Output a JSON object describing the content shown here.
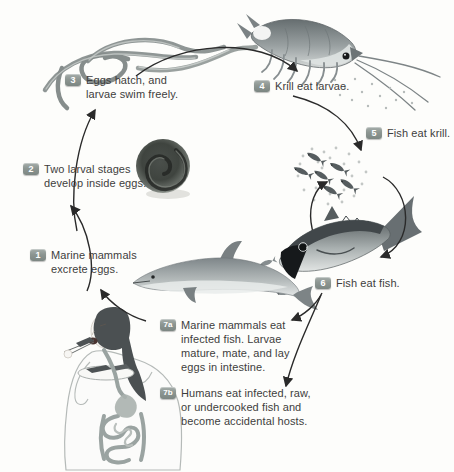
{
  "figure": {
    "kind": "parasite-life-cycle-diagram",
    "background_color": "#fdfdfb",
    "badge_color": "#8d9692",
    "badge_text_color": "#ffffff",
    "label_text_color": "#3d3d3d",
    "arrow_color": "#2a2a2a",
    "art_palette": {
      "dark": "#4a5052",
      "mid": "#8a9193",
      "light": "#dfe3e2"
    },
    "steps": [
      {
        "id": "1",
        "text": "Marine mammals excrete eggs."
      },
      {
        "id": "2",
        "text": "Two larval stages develop inside eggs."
      },
      {
        "id": "3",
        "text": "Eggs hatch, and larvae swim freely."
      },
      {
        "id": "4",
        "text": "Krill eat larvae."
      },
      {
        "id": "5",
        "text": "Fish eat krill."
      },
      {
        "id": "6",
        "text": "Fish eat fish."
      },
      {
        "id": "7a",
        "text": "Marine mammals eat infected fish. Larvae mature, mate, and lay eggs in intestine."
      },
      {
        "id": "7b",
        "text": "Humans eat infected, raw, or undercooked fish and become accidental hosts."
      }
    ],
    "illustrations": [
      "larvae-worms",
      "parasite-egg",
      "krill",
      "fish-school",
      "large-fish",
      "dolphin",
      "human-eating-fish"
    ]
  }
}
